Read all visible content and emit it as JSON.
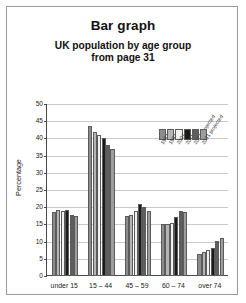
{
  "title": "Bar graph",
  "subtitle_line1": "UK population by age group",
  "subtitle_line2": "from page 31",
  "chart_data": {
    "type": "bar",
    "title": "Bar graph",
    "subtitle": "UK population by age group from page 31",
    "xlabel": "",
    "ylabel": "Percentage",
    "ylim": [
      0,
      50
    ],
    "ytick_step": 5,
    "yticks": [
      "0",
      "5",
      "10",
      "15",
      "20",
      "25",
      "30",
      "35",
      "40",
      "45",
      "50"
    ],
    "grid": true,
    "legend_position": "top-right",
    "categories": [
      "under 15",
      "15 – 44",
      "45 – 59",
      "60 – 74",
      "over 74"
    ],
    "series": [
      {
        "name": "1981",
        "color": "#8c8c8c",
        "values": [
          18.5,
          43.5,
          17.5,
          15.2,
          6.5
        ]
      },
      {
        "name": "1991",
        "color": "#b5b5b5",
        "values": [
          19.2,
          42.0,
          17.8,
          15.0,
          7.0
        ]
      },
      {
        "name": "2001",
        "color": "#f2f2f2",
        "values": [
          19.0,
          41.0,
          19.0,
          15.5,
          7.5
        ]
      },
      {
        "name": "2011",
        "color": "#1a1a1a",
        "values": [
          19.3,
          40.0,
          21.0,
          17.3,
          8.0
        ]
      },
      {
        "name": "2021 projected",
        "color": "#5e5e5e",
        "values": [
          17.8,
          38.0,
          20.0,
          18.8,
          10.2
        ]
      },
      {
        "name": "2031 projected",
        "color": "#9d9d9d",
        "values": [
          17.5,
          37.0,
          19.0,
          18.5,
          11.0
        ]
      }
    ]
  }
}
